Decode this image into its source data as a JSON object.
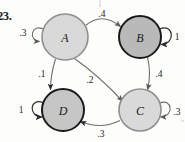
{
  "problem": {
    "number": "23."
  },
  "diagram": {
    "type": "markov-chain-state-diagram",
    "nodes": [
      {
        "id": "A",
        "label": "A",
        "cx": 65,
        "cy": 37,
        "r": 23,
        "fill": "#d9d9d9",
        "stroke": "#8f8f8f",
        "stroke_width": 1.6
      },
      {
        "id": "B",
        "label": "B",
        "cx": 140,
        "cy": 37,
        "r": 21,
        "fill": "#b9b9b9",
        "stroke": "#1a1a1a",
        "stroke_width": 2.0
      },
      {
        "id": "C",
        "label": "C",
        "cx": 140,
        "cy": 110,
        "r": 21,
        "fill": "#d9d9d9",
        "stroke": "#8f8f8f",
        "stroke_width": 1.6
      },
      {
        "id": "D",
        "label": "D",
        "cx": 63,
        "cy": 110,
        "r": 21,
        "fill": "#c6c6c6",
        "stroke": "#1a1a1a",
        "stroke_width": 2.0
      }
    ],
    "self_loops": [
      {
        "node": "A",
        "label": ".3",
        "side": "left",
        "label_x": 23,
        "label_y": 33
      },
      {
        "node": "B",
        "label": "1",
        "side": "right",
        "label_x": 177,
        "label_y": 37
      },
      {
        "node": "C",
        "label": ".3",
        "side": "right",
        "label_x": 177,
        "label_y": 112
      },
      {
        "node": "D",
        "label": "1",
        "side": "left",
        "label_x": 21,
        "label_y": 110
      }
    ],
    "edges": [
      {
        "from": "A",
        "to": "B",
        "label": ".4",
        "label_x": 102,
        "label_y": 14
      },
      {
        "from": "A",
        "to": "D",
        "label": ".1",
        "label_x": 42,
        "label_y": 74
      },
      {
        "from": "A",
        "to": "C",
        "label": ".2",
        "label_x": 90,
        "label_y": 80
      },
      {
        "from": "B",
        "to": "C",
        "label": ".4",
        "label_x": 159,
        "label_y": 74
      },
      {
        "from": "C",
        "to": "D",
        "label": ".3",
        "label_x": 101,
        "label_y": 134
      }
    ],
    "colors": {
      "edge_stroke": "#6f6f6f",
      "text": "#1c1c1c",
      "background": "#fdfdfc"
    }
  }
}
